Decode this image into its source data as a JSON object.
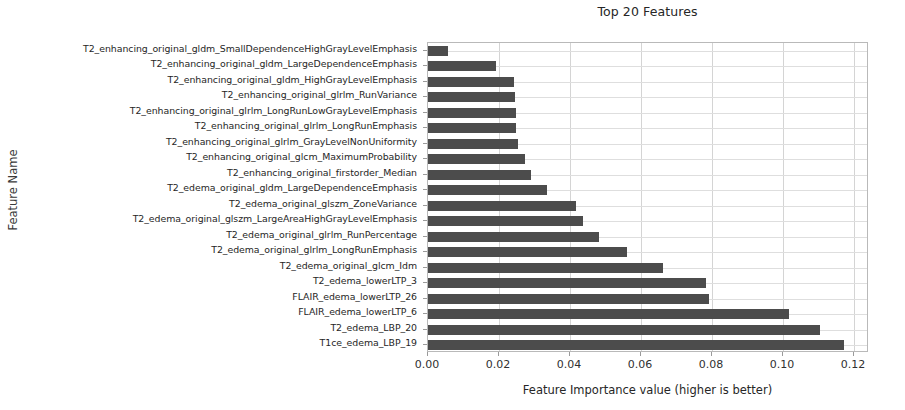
{
  "chart_data": {
    "type": "bar",
    "orientation": "horizontal",
    "title": "Top 20 Features",
    "xlabel": "Feature Importance value (higher is better)",
    "ylabel": "Feature Name",
    "xlim": [
      0.0,
      0.1242
    ],
    "xticks": [
      "0.00",
      "0.02",
      "0.04",
      "0.06",
      "0.08",
      "0.10",
      "0.12"
    ],
    "xtick_values": [
      0.0,
      0.02,
      0.04,
      0.06,
      0.08,
      0.1,
      0.12
    ],
    "grid": true,
    "legend": "none",
    "bar_color": "#4c4c4c",
    "categories": [
      "T2_enhancing_original_gldm_SmallDependenceHighGrayLevelEmphasis",
      "T2_enhancing_original_gldm_LargeDependenceEmphasis",
      "T2_enhancing_original_gldm_HighGrayLevelEmphasis",
      "T2_enhancing_original_glrlm_RunVariance",
      "T2_enhancing_original_glrlm_LongRunLowGrayLevelEmphasis",
      "T2_enhancing_original_glrlm_LongRunEmphasis",
      "T2_enhancing_original_glrlm_GrayLevelNonUniformity",
      "T2_enhancing_original_glcm_MaximumProbability",
      "T2_enhancing_original_firstorder_Median",
      "T2_edema_original_gldm_LargeDependenceEmphasis",
      "T2_edema_original_glszm_ZoneVariance",
      "T2_edema_original_glszm_LargeAreaHighGrayLevelEmphasis",
      "T2_edema_original_glrlm_RunPercentage",
      "T2_edema_original_glrlm_LongRunEmphasis",
      "T2_edema_original_glcm_Idm",
      "T2_edema_lowerLTP_3",
      "FLAIR_edema_lowerLTP_26",
      "FLAIR_edema_lowerLTP_6",
      "T2_edema_LBP_20",
      "T1ce_edema_LBP_19"
    ],
    "values": [
      0.0055,
      0.0192,
      0.0243,
      0.0245,
      0.0247,
      0.0247,
      0.0254,
      0.0272,
      0.0289,
      0.0335,
      0.0417,
      0.0437,
      0.0481,
      0.0561,
      0.0661,
      0.0783,
      0.0791,
      0.1017,
      0.1104,
      0.1172
    ]
  }
}
